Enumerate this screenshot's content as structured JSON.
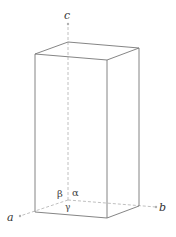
{
  "diagram": {
    "title": "",
    "type": "unit cell (tetragonal / orthorhombic prism)",
    "axes": {
      "a": "a",
      "b": "b",
      "c": "c"
    },
    "angles": {
      "alpha": "α",
      "beta": "β",
      "gamma": "γ"
    },
    "colors": {
      "edge": "#777777",
      "axis": "#aaaaaa",
      "text": "#333333"
    }
  }
}
